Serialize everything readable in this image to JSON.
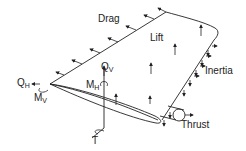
{
  "diagram": {
    "type": "wing-loads",
    "colors": {
      "stroke": "#222222",
      "background": "#ffffff"
    },
    "labels": {
      "drag": "Drag",
      "lift": "Lift",
      "inertia": "Inertia",
      "thrust": "Thrust",
      "qh_main": "Q",
      "qh_sub": "H",
      "mv_main": "M",
      "mv_sub": "V",
      "qv_main": "Q",
      "qv_sub": "V",
      "mh_main": "M",
      "mh_sub": "H",
      "torque": "T"
    }
  }
}
